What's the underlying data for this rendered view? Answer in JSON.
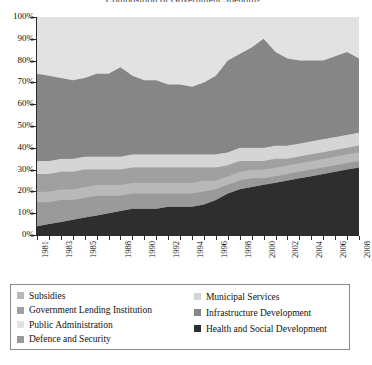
{
  "title": "Composition of Government Spending",
  "legend": {
    "columns": [
      {
        "items": [
          {
            "label": "Subsidies",
            "color": "#b9b9b9"
          },
          {
            "label": "Government Lending Institution",
            "color": "#a0a0a0"
          },
          {
            "label": "Public Administration",
            "color": "#e2e2e2"
          },
          {
            "label": "Defence and Security",
            "color": "#9a9a9a"
          }
        ]
      },
      {
        "items": [
          {
            "label": "Municipal Services",
            "color": "#d5d5d5"
          },
          {
            "label": "Infrastructure Development",
            "color": "#868686"
          },
          {
            "label": "Health and Social Development",
            "color": "#2e2e2e"
          }
        ]
      }
    ]
  },
  "chart_data": {
    "type": "area",
    "stacked": true,
    "normalized": true,
    "title": "Composition of Government Spending",
    "xlabel": "",
    "ylabel": "",
    "ylim": [
      0,
      100
    ],
    "ytick_labels": [
      "0%",
      "10%",
      "20%",
      "30%",
      "40%",
      "50%",
      "60%",
      "70%",
      "80%",
      "90%",
      "100%"
    ],
    "yticks": [
      0,
      10,
      20,
      30,
      40,
      50,
      60,
      70,
      80,
      90,
      100
    ],
    "grid": false,
    "legend_position": "below",
    "x": [
      1981,
      1982,
      1983,
      1984,
      1985,
      1986,
      1987,
      1988,
      1989,
      1990,
      1991,
      1992,
      1993,
      1994,
      1995,
      1996,
      1997,
      1998,
      1999,
      2000,
      2001,
      2002,
      2003,
      2004,
      2005,
      2006,
      2007,
      2008
    ],
    "xtick_labels": [
      "1981",
      "1983",
      "1985",
      "1988",
      "1990",
      "1992",
      "1994",
      "1996",
      "1998",
      "2000",
      "2002",
      "2004",
      "2006",
      "2008"
    ],
    "xtick_label_rotation": -90,
    "series": [
      {
        "name": "Health and Social Development",
        "color": "#2e2e2e",
        "values": [
          4,
          5,
          6,
          7,
          8,
          9,
          10,
          11,
          12,
          12,
          12,
          13,
          13,
          13,
          14,
          16,
          19,
          21,
          22,
          23,
          24,
          25,
          26,
          27,
          28,
          29,
          30,
          31
        ]
      },
      {
        "name": "Defence and Security",
        "color": "#9a9a9a",
        "values": [
          11,
          10,
          10,
          9,
          9,
          9,
          8,
          7,
          7,
          7,
          7,
          6,
          6,
          6,
          6,
          5,
          4,
          4,
          4,
          3,
          3,
          3,
          3,
          3,
          3,
          3,
          3,
          3
        ]
      },
      {
        "name": "Subsidies",
        "color": "#b9b9b9",
        "values": [
          5,
          5,
          5,
          5,
          5,
          5,
          5,
          5,
          5,
          5,
          5,
          5,
          5,
          5,
          5,
          4,
          4,
          4,
          4,
          4,
          4,
          4,
          4,
          4,
          4,
          4,
          4,
          4
        ]
      },
      {
        "name": "Government Lending Institution",
        "color": "#a0a0a0",
        "values": [
          8,
          8,
          8,
          8,
          8,
          7,
          7,
          7,
          7,
          7,
          7,
          7,
          7,
          7,
          6,
          6,
          5,
          5,
          4,
          4,
          4,
          3,
          3,
          3,
          3,
          3,
          3,
          3
        ]
      },
      {
        "name": "Municipal Services",
        "color": "#d5d5d5",
        "values": [
          6,
          6,
          6,
          6,
          6,
          6,
          6,
          6,
          6,
          6,
          6,
          6,
          6,
          6,
          6,
          6,
          6,
          6,
          6,
          6,
          6,
          6,
          6,
          6,
          6,
          6,
          6,
          6
        ]
      },
      {
        "name": "Infrastructure Development",
        "color": "#868686",
        "values": [
          40,
          39,
          37,
          36,
          36,
          38,
          38,
          41,
          36,
          34,
          34,
          32,
          32,
          31,
          33,
          36,
          42,
          43,
          46,
          50,
          43,
          40,
          38,
          37,
          36,
          37,
          38,
          34
        ]
      },
      {
        "name": "Public Administration",
        "color": "#e2e2e2",
        "values": [
          26,
          27,
          28,
          29,
          28,
          26,
          26,
          23,
          27,
          29,
          29,
          31,
          31,
          32,
          30,
          27,
          20,
          17,
          14,
          10,
          16,
          19,
          20,
          20,
          20,
          18,
          16,
          19
        ]
      }
    ]
  }
}
